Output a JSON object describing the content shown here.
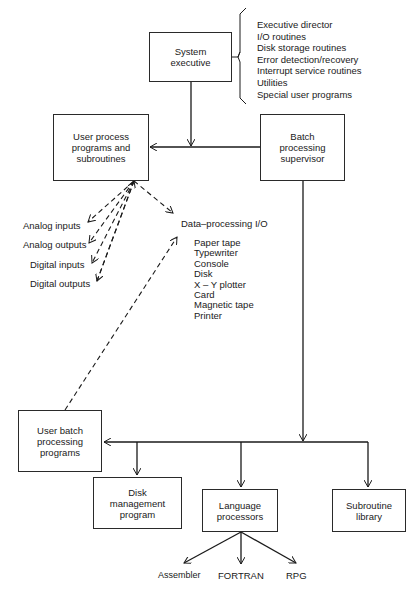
{
  "diagram": {
    "nodes": {
      "system_executive": "System\nexecutive",
      "user_process": "User process\nprograms and\nsubroutines",
      "batch_supervisor": "Batch\nprocessing\nsupervisor",
      "user_batch": "User batch\nprocessing\nprograms",
      "disk_management": "Disk\nmanagement\nprogram",
      "language_processors": "Language\nprocessors",
      "subroutine_library": "Subroutine\nlibrary"
    },
    "system_executive_components": [
      "Executive director",
      "I/O routines",
      "Disk storage routines",
      "Error detection/recovery",
      "Interrupt service routines",
      "Utilities",
      "Special user programs"
    ],
    "process_io": {
      "analog_inputs": "Analog inputs",
      "analog_outputs": "Analog outputs",
      "digital_inputs": "Digital inputs",
      "digital_outputs": "Digital outputs"
    },
    "data_processing_io": {
      "title": "Data–processing I/O",
      "devices": [
        "Paper tape",
        "Typewriter",
        "Console",
        "Disk",
        "X – Y plotter",
        "Card",
        "Magnetic tape",
        "Printer"
      ]
    },
    "languages": {
      "assembler": "Assembler",
      "fortran": "FORTRAN",
      "rpg": "RPG"
    }
  }
}
